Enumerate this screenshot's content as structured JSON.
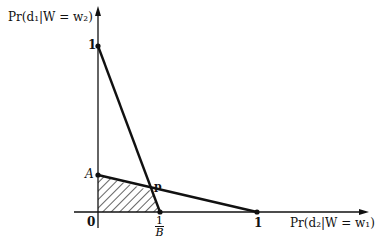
{
  "diagram": {
    "y_axis_label": "Pr(d₁|W = w₂)",
    "x_axis_label": "Pr(d₂|W = w₁)",
    "y_tick_1": "1",
    "y_tick_A": "A",
    "origin": "0",
    "x_tick_1": "1",
    "x_tick_frac": {
      "num": "1",
      "den": "B"
    },
    "point_p": "p",
    "lines": [
      {
        "from": "(0,1)",
        "to": "(1/B,0)"
      },
      {
        "from": "(0,A)",
        "to": "(1,0)"
      }
    ],
    "shaded_region": "polygon 0, A, p, 1/B (hatched)",
    "colors": {
      "line": "#111111",
      "background": "#ffffff"
    }
  }
}
